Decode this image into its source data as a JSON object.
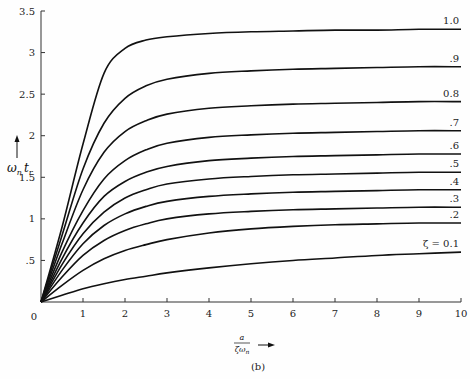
{
  "chart_data": {
    "type": "line",
    "title": "",
    "caption": "(b)",
    "xlabel": "a / ζω_n",
    "ylabel": "ω_n t_r",
    "xlim": [
      0,
      10
    ],
    "ylim": [
      0,
      3.5
    ],
    "grid": false,
    "legend": "inline labels at right end of curves",
    "x_ticks": [
      0,
      1,
      2,
      3,
      4,
      5,
      6,
      7,
      8,
      9,
      10
    ],
    "x_tick_labels": [
      "0",
      "1",
      "2",
      "3",
      "4",
      "5",
      "6",
      "7",
      "8",
      "9",
      "10"
    ],
    "y_ticks": [
      0.5,
      1,
      1.5,
      2,
      2.5,
      3,
      3.5
    ],
    "y_tick_labels": [
      ".5",
      "1",
      "1.5",
      "2",
      "2.5",
      "3",
      "3.5"
    ],
    "x": [
      0,
      0.5,
      1,
      1.5,
      2,
      2.5,
      3,
      4,
      5,
      6,
      7,
      8,
      9,
      10
    ],
    "series": [
      {
        "name": "1.0",
        "label": "1.0",
        "values": [
          0,
          0.9,
          1.9,
          2.75,
          3.05,
          3.15,
          3.19,
          3.23,
          3.25,
          3.26,
          3.27,
          3.27,
          3.28,
          3.28
        ]
      },
      {
        "name": "0.9",
        "label": ".9",
        "values": [
          0,
          0.8,
          1.6,
          2.15,
          2.45,
          2.6,
          2.68,
          2.75,
          2.78,
          2.8,
          2.81,
          2.82,
          2.83,
          2.83
        ]
      },
      {
        "name": "0.8",
        "label": "0.8",
        "values": [
          0,
          0.7,
          1.35,
          1.8,
          2.05,
          2.18,
          2.26,
          2.33,
          2.36,
          2.38,
          2.39,
          2.4,
          2.41,
          2.41
        ]
      },
      {
        "name": "0.7",
        "label": ".7",
        "values": [
          0,
          0.6,
          1.1,
          1.48,
          1.7,
          1.83,
          1.91,
          1.98,
          2.01,
          2.03,
          2.04,
          2.05,
          2.06,
          2.06
        ]
      },
      {
        "name": "0.6",
        "label": ".6",
        "values": [
          0,
          0.52,
          0.95,
          1.27,
          1.45,
          1.56,
          1.63,
          1.7,
          1.73,
          1.75,
          1.76,
          1.77,
          1.78,
          1.78
        ]
      },
      {
        "name": "0.5",
        "label": ".5",
        "values": [
          0,
          0.45,
          0.82,
          1.08,
          1.25,
          1.35,
          1.42,
          1.48,
          1.51,
          1.53,
          1.54,
          1.55,
          1.56,
          1.56
        ]
      },
      {
        "name": "0.4",
        "label": ".4",
        "values": [
          0,
          0.38,
          0.7,
          0.92,
          1.06,
          1.15,
          1.21,
          1.27,
          1.3,
          1.32,
          1.33,
          1.34,
          1.35,
          1.35
        ]
      },
      {
        "name": "0.3",
        "label": ".3",
        "values": [
          0,
          0.3,
          0.56,
          0.74,
          0.86,
          0.94,
          1.0,
          1.06,
          1.09,
          1.11,
          1.12,
          1.13,
          1.14,
          1.14
        ]
      },
      {
        "name": "0.2",
        "label": ".2",
        "values": [
          0,
          0.2,
          0.38,
          0.52,
          0.62,
          0.69,
          0.75,
          0.83,
          0.88,
          0.91,
          0.93,
          0.94,
          0.95,
          0.95
        ]
      },
      {
        "name": "ζ = 0.1",
        "label": "ζ = 0.1",
        "values": [
          0,
          0.08,
          0.16,
          0.22,
          0.27,
          0.31,
          0.35,
          0.41,
          0.46,
          0.5,
          0.53,
          0.56,
          0.58,
          0.6
        ]
      }
    ]
  },
  "labels": {
    "origin": "0",
    "caption": "(b)",
    "ylabel_main": "ω",
    "ylabel_sub1": "n",
    "ylabel_t": "t",
    "ylabel_sub2": "r",
    "xlabel_num": "a",
    "xlabel_den": "ζω",
    "xlabel_den_sub": "n"
  }
}
